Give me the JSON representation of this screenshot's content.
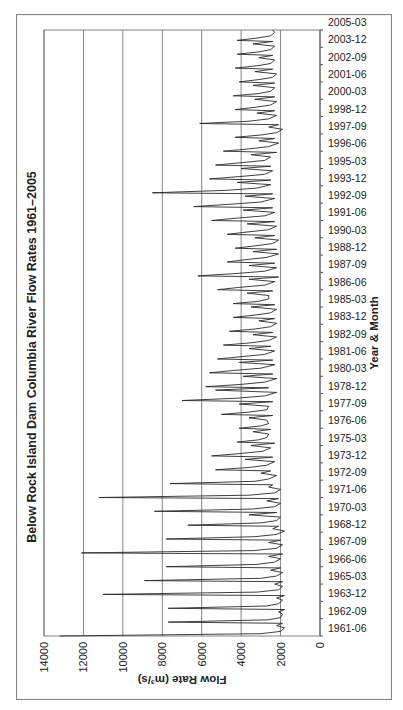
{
  "chart_data": {
    "type": "line",
    "title": "Below Rock Island Dam Columbia River Flow Rates 1961–2005",
    "xlabel": "Year & Month",
    "ylabel": "Flow Rate (m³/s)",
    "ylim": [
      0,
      14000
    ],
    "yticks": [
      0,
      2000,
      4000,
      6000,
      8000,
      10000,
      12000,
      14000
    ],
    "xticks": [
      "1961-06",
      "1962-09",
      "1963-12",
      "1965-03",
      "1966-06",
      "1967-09",
      "1968-12",
      "1970-03",
      "1971-06",
      "1972-09",
      "1973-12",
      "1975-03",
      "1976-06",
      "1977-09",
      "1978-12",
      "1980-03",
      "1981-06",
      "1982-09",
      "1983-12",
      "1985-03",
      "1986-06",
      "1987-09",
      "1988-12",
      "1990-03",
      "1991-06",
      "1992-09",
      "1993-12",
      "1995-03",
      "1996-06",
      "1997-09",
      "1998-12",
      "2000-03",
      "2001-06",
      "2002-09",
      "2003-12",
      "2005-03"
    ],
    "x_start": "1961-06",
    "x_end": "2005-03",
    "grid": "horizontal major gridlines",
    "legend": "none",
    "orientation": "figure rotated 90° counter-clockwise on page",
    "series": [
      {
        "name": "Flow Rate",
        "monthly_points_note": "approximate values read from plot, [months since 1961-06, m3/s]",
        "points": [
          [
            0,
            13200
          ],
          [
            2,
            3000
          ],
          [
            4,
            2000
          ],
          [
            7,
            1800
          ],
          [
            9,
            2200
          ],
          [
            11,
            1900
          ],
          [
            12,
            7700
          ],
          [
            14,
            2600
          ],
          [
            16,
            2000
          ],
          [
            19,
            1900
          ],
          [
            21,
            2100
          ],
          [
            23,
            1800
          ],
          [
            24,
            7700
          ],
          [
            26,
            2700
          ],
          [
            28,
            2100
          ],
          [
            31,
            1900
          ],
          [
            33,
            2200
          ],
          [
            35,
            1800
          ],
          [
            36,
            11000
          ],
          [
            38,
            3200
          ],
          [
            40,
            2100
          ],
          [
            43,
            1900
          ],
          [
            45,
            2300
          ],
          [
            47,
            1900
          ],
          [
            48,
            8900
          ],
          [
            50,
            3000
          ],
          [
            52,
            2200
          ],
          [
            55,
            1900
          ],
          [
            57,
            2500
          ],
          [
            59,
            2000
          ],
          [
            60,
            7800
          ],
          [
            62,
            3200
          ],
          [
            64,
            2300
          ],
          [
            67,
            2000
          ],
          [
            69,
            2600
          ],
          [
            71,
            1900
          ],
          [
            72,
            12100
          ],
          [
            74,
            3400
          ],
          [
            76,
            2200
          ],
          [
            79,
            1900
          ],
          [
            81,
            2600
          ],
          [
            83,
            2000
          ],
          [
            84,
            7800
          ],
          [
            86,
            3300
          ],
          [
            88,
            2200
          ],
          [
            91,
            1800
          ],
          [
            93,
            2400
          ],
          [
            95,
            2100
          ],
          [
            96,
            6700
          ],
          [
            98,
            3000
          ],
          [
            100,
            2200
          ],
          [
            103,
            2000
          ],
          [
            105,
            3600
          ],
          [
            107,
            2200
          ],
          [
            108,
            8400
          ],
          [
            110,
            3400
          ],
          [
            112,
            2300
          ],
          [
            115,
            2000
          ],
          [
            117,
            2700
          ],
          [
            119,
            2100
          ],
          [
            120,
            11200
          ],
          [
            122,
            3600
          ],
          [
            124,
            2300
          ],
          [
            127,
            2000
          ],
          [
            129,
            2600
          ],
          [
            131,
            2400
          ],
          [
            132,
            7600
          ],
          [
            134,
            3300
          ],
          [
            136,
            2600
          ],
          [
            139,
            2200
          ],
          [
            141,
            3000
          ],
          [
            143,
            2500
          ],
          [
            144,
            5300
          ],
          [
            146,
            3600
          ],
          [
            148,
            2700
          ],
          [
            151,
            2300
          ],
          [
            153,
            3800
          ],
          [
            155,
            2400
          ],
          [
            156,
            5500
          ],
          [
            158,
            4100
          ],
          [
            160,
            2900
          ],
          [
            163,
            2500
          ],
          [
            165,
            3500
          ],
          [
            167,
            2300
          ],
          [
            168,
            4200
          ],
          [
            170,
            3100
          ],
          [
            172,
            2700
          ],
          [
            175,
            2600
          ],
          [
            177,
            3400
          ],
          [
            179,
            2500
          ],
          [
            180,
            4100
          ],
          [
            182,
            3000
          ],
          [
            184,
            2600
          ],
          [
            187,
            2700
          ],
          [
            189,
            3600
          ],
          [
            191,
            2400
          ],
          [
            192,
            5000
          ],
          [
            194,
            3600
          ],
          [
            196,
            2700
          ],
          [
            199,
            2600
          ],
          [
            201,
            4100
          ],
          [
            203,
            2400
          ],
          [
            204,
            7000
          ],
          [
            206,
            4200
          ],
          [
            208,
            2800
          ],
          [
            211,
            2200
          ],
          [
            213,
            5300
          ],
          [
            215,
            2600
          ],
          [
            216,
            5800
          ],
          [
            218,
            4000
          ],
          [
            220,
            2800
          ],
          [
            223,
            2200
          ],
          [
            225,
            3900
          ],
          [
            227,
            2400
          ],
          [
            228,
            5600
          ],
          [
            230,
            4400
          ],
          [
            232,
            3000
          ],
          [
            235,
            2300
          ],
          [
            237,
            4100
          ],
          [
            239,
            2400
          ],
          [
            240,
            5200
          ],
          [
            242,
            4000
          ],
          [
            244,
            2800
          ],
          [
            247,
            2300
          ],
          [
            249,
            3600
          ],
          [
            251,
            2500
          ],
          [
            252,
            4900
          ],
          [
            254,
            3500
          ],
          [
            256,
            2600
          ],
          [
            259,
            2200
          ],
          [
            261,
            3400
          ],
          [
            263,
            2400
          ],
          [
            264,
            4600
          ],
          [
            266,
            3300
          ],
          [
            268,
            2500
          ],
          [
            271,
            2200
          ],
          [
            273,
            3100
          ],
          [
            275,
            2300
          ],
          [
            276,
            4400
          ],
          [
            278,
            3300
          ],
          [
            280,
            2500
          ],
          [
            283,
            2200
          ],
          [
            285,
            3500
          ],
          [
            287,
            2300
          ],
          [
            288,
            4400
          ],
          [
            290,
            3100
          ],
          [
            292,
            2600
          ],
          [
            295,
            2600
          ],
          [
            297,
            3700
          ],
          [
            299,
            2400
          ],
          [
            300,
            5200
          ],
          [
            302,
            4100
          ],
          [
            304,
            2800
          ],
          [
            307,
            2300
          ],
          [
            309,
            3600
          ],
          [
            311,
            2100
          ],
          [
            312,
            6200
          ],
          [
            314,
            4300
          ],
          [
            316,
            2800
          ],
          [
            319,
            2200
          ],
          [
            321,
            3600
          ],
          [
            323,
            2300
          ],
          [
            324,
            4700
          ],
          [
            326,
            3800
          ],
          [
            328,
            2700
          ],
          [
            331,
            2100
          ],
          [
            333,
            3400
          ],
          [
            335,
            2200
          ],
          [
            336,
            4300
          ],
          [
            338,
            3300
          ],
          [
            340,
            2400
          ],
          [
            343,
            2100
          ],
          [
            345,
            3300
          ],
          [
            347,
            2300
          ],
          [
            348,
            4700
          ],
          [
            350,
            3700
          ],
          [
            352,
            2600
          ],
          [
            355,
            2200
          ],
          [
            357,
            3700
          ],
          [
            359,
            2300
          ],
          [
            360,
            5500
          ],
          [
            362,
            4200
          ],
          [
            364,
            2800
          ],
          [
            367,
            2300
          ],
          [
            369,
            3900
          ],
          [
            371,
            2400
          ],
          [
            372,
            6400
          ],
          [
            374,
            4600
          ],
          [
            376,
            3000
          ],
          [
            379,
            2300
          ],
          [
            381,
            3800
          ],
          [
            383,
            2400
          ],
          [
            384,
            8500
          ],
          [
            386,
            4800
          ],
          [
            388,
            3200
          ],
          [
            391,
            2500
          ],
          [
            393,
            4200
          ],
          [
            395,
            2500
          ],
          [
            396,
            5600
          ],
          [
            398,
            4100
          ],
          [
            400,
            2800
          ],
          [
            403,
            2400
          ],
          [
            405,
            4000
          ],
          [
            407,
            2500
          ],
          [
            408,
            5300
          ],
          [
            410,
            4000
          ],
          [
            412,
            2800
          ],
          [
            415,
            2500
          ],
          [
            417,
            3500
          ],
          [
            419,
            2200
          ],
          [
            420,
            4900
          ],
          [
            422,
            3600
          ],
          [
            424,
            2600
          ],
          [
            427,
            2100
          ],
          [
            429,
            3100
          ],
          [
            431,
            2300
          ],
          [
            432,
            4300
          ],
          [
            434,
            3000
          ],
          [
            436,
            2200
          ],
          [
            439,
            1900
          ],
          [
            441,
            2600
          ],
          [
            443,
            2100
          ],
          [
            444,
            6100
          ],
          [
            446,
            3600
          ],
          [
            448,
            2600
          ],
          [
            451,
            2200
          ],
          [
            453,
            3200
          ],
          [
            455,
            2300
          ],
          [
            456,
            4300
          ],
          [
            458,
            3300
          ],
          [
            460,
            2500
          ],
          [
            463,
            2200
          ],
          [
            465,
            3300
          ],
          [
            467,
            2300
          ],
          [
            468,
            4400
          ],
          [
            470,
            3100
          ],
          [
            472,
            2500
          ],
          [
            475,
            2300
          ],
          [
            477,
            3400
          ],
          [
            479,
            2300
          ],
          [
            480,
            4100
          ],
          [
            482,
            3100
          ],
          [
            484,
            2400
          ],
          [
            487,
            2200
          ],
          [
            489,
            3300
          ],
          [
            491,
            2400
          ],
          [
            492,
            4300
          ],
          [
            494,
            3200
          ],
          [
            496,
            2500
          ],
          [
            499,
            2300
          ],
          [
            501,
            3100
          ],
          [
            503,
            2400
          ],
          [
            504,
            4200
          ],
          [
            506,
            3100
          ],
          [
            508,
            2500
          ],
          [
            511,
            2300
          ],
          [
            513,
            3400
          ],
          [
            515,
            2400
          ],
          [
            516,
            4200
          ],
          [
            518,
            3200
          ],
          [
            520,
            2500
          ],
          [
            523,
            2300
          ],
          [
            525,
            2400
          ]
        ]
      }
    ]
  }
}
